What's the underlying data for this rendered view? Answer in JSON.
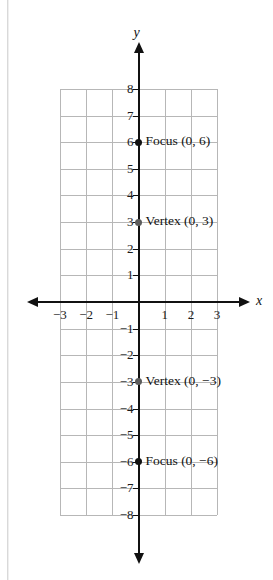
{
  "header_remnant": {
    "left_text": "",
    "right_text": ""
  },
  "chart_data": {
    "type": "scatter",
    "title": "",
    "xlabel": "x",
    "ylabel": "y",
    "xlim": [
      -3,
      3
    ],
    "ylim": [
      -8,
      8
    ],
    "grid": true,
    "legend": "none",
    "x_ticks": [
      "-3",
      "-2",
      "-1",
      "1",
      "2",
      "3"
    ],
    "x_tick_values": [
      -3,
      -2,
      -1,
      1,
      2,
      3
    ],
    "y_ticks": [
      "8",
      "7",
      "6",
      "5",
      "4",
      "3",
      "2",
      "1",
      "-1",
      "-2",
      "-3",
      "-4",
      "-5",
      "-6",
      "-7",
      "-8"
    ],
    "y_tick_values": [
      8,
      7,
      6,
      5,
      4,
      3,
      2,
      1,
      -1,
      -2,
      -3,
      -4,
      -5,
      -6,
      -7,
      -8
    ],
    "points": [
      {
        "label": "Focus (0, 6)",
        "x": 0,
        "y": 6,
        "kind": "focus"
      },
      {
        "label": "Vertex (0, 3)",
        "x": 0,
        "y": 3,
        "kind": "vertex"
      },
      {
        "label": "Vertex (0, −3)",
        "x": 0,
        "y": -3,
        "kind": "vertex"
      },
      {
        "label": "Focus (0, −6)",
        "x": 0,
        "y": -6,
        "kind": "focus"
      }
    ],
    "axis_colors": {
      "axis": "#111111",
      "grid": "#b7b7b7",
      "point": "#111111"
    }
  }
}
